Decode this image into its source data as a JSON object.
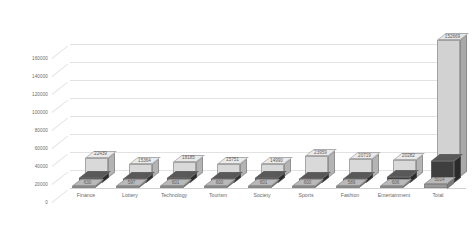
{
  "chart_data": {
    "type": "bar",
    "title": "",
    "subtitle": "",
    "xlabel": "",
    "ylabel": "",
    "ylim": [
      0,
      180000
    ],
    "yticks": [
      0,
      20000,
      40000,
      60000,
      80000,
      100000,
      120000,
      140000,
      160000
    ],
    "ytick_labels": [
      "0",
      "20000",
      "40000",
      "60000",
      "80000",
      "100000",
      "120000",
      "140000",
      "160000"
    ],
    "grid": true,
    "legend": "none",
    "style": "3d-clustered-column",
    "categories": [
      "Finance",
      "Lottery",
      "Technology",
      "Tourism",
      "Society",
      "Sports",
      "Fashion",
      "Entertainment",
      "Total"
    ],
    "series": [
      {
        "name": "series-1",
        "color": "#d9d9d9",
        "values": [
          22439,
          15364,
          18185,
          15751,
          14990,
          23959,
          20719,
          20282,
          152669
        ]
      },
      {
        "name": "series-2",
        "color": "#3f3f3f",
        "values": [
          5625,
          4327,
          5460,
          4781,
          5026,
          4374,
          4917,
          6425,
          24651
        ]
      },
      {
        "name": "series-3",
        "color": "#9a9a9a",
        "values": [
          630,
          597,
          601,
          600,
          601,
          600,
          589,
          606,
          5014
        ]
      }
    ]
  },
  "labels": {
    "yticks": [
      "160000",
      "140000",
      "120000",
      "100000",
      "80000",
      "60000",
      "40000",
      "20000",
      "0"
    ],
    "categories": [
      "Finance",
      "Lottery",
      "Technology",
      "Tourism",
      "Society",
      "Sports",
      "Fashion",
      "Entertainment",
      "Total"
    ],
    "series1": [
      "22439",
      "15364",
      "18185",
      "15751",
      "14990",
      "23959",
      "20719",
      "20282",
      "152669"
    ],
    "series2": [
      "5625",
      "4327",
      "5460",
      "4781",
      "5026",
      "4374",
      "4917",
      "6425",
      "24651"
    ],
    "series3": [
      "630",
      "597",
      "601",
      "600",
      "601",
      "600",
      "589",
      "606",
      "5014"
    ]
  },
  "colors": {
    "series1": "#d9d9d9",
    "series2": "#3f3f3f",
    "series3": "#9a9a9a",
    "grid": "#e2e2e2",
    "text": "#6b6b6b",
    "background": "#ffffff"
  }
}
